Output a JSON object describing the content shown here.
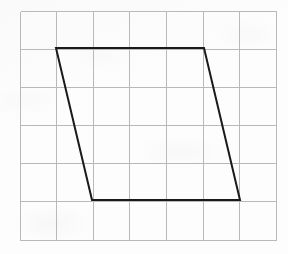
{
  "figure": {
    "kind": "geometry-figure",
    "canvas": {
      "width": 288,
      "height": 254,
      "background_color": "#fdfdfd"
    },
    "grid": {
      "columns": 7,
      "rows": 6,
      "origin_x": 20,
      "origin_y": 11,
      "cell_width": 36.57,
      "cell_height": 38.17,
      "line_color": "#b9b9b9",
      "line_width": 1,
      "x_positions": [
        20,
        56.6,
        93.1,
        129.7,
        166.3,
        202.9,
        239.4,
        276
      ],
      "y_positions": [
        11,
        49.2,
        87.3,
        125.5,
        163.7,
        201.8,
        240
      ]
    },
    "shape": {
      "name": "parallelogram",
      "stroke_color": "#1a1a1a",
      "stroke_width": 2,
      "fill": "none",
      "vertices": [
        {
          "label": "top-left",
          "x": 56,
          "y": 48,
          "grid_col": 1,
          "grid_row": 1
        },
        {
          "label": "top-right",
          "x": 204,
          "y": 48,
          "grid_col": 5,
          "grid_row": 1
        },
        {
          "label": "bottom-right",
          "x": 240,
          "y": 200,
          "grid_col": 6,
          "grid_row": 5
        },
        {
          "label": "bottom-left",
          "x": 92,
          "y": 200,
          "grid_col": 2,
          "grid_row": 5
        }
      ],
      "points_attr": "56,48 204,48 240,200 92,200",
      "base_cells": 4,
      "height_cells": 4,
      "slant_cells": 1
    }
  }
}
